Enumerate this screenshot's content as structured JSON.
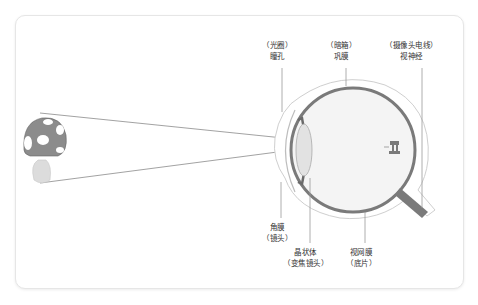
{
  "diagram": {
    "title": "",
    "object": "mushroom",
    "colors": {
      "line": "#8a8a8a",
      "eye_wall": "#7a7a7a",
      "eye_fill": "#f3f3f3",
      "lens_fill": "#e2e2e2",
      "mushroom_cap": "#8c8c8c",
      "mushroom_stem": "#dcdcdc",
      "border": "#e6e6e6"
    },
    "labels_top": [
      {
        "id": "pupil",
        "line1": "（光圈）",
        "line2": "瞳孔"
      },
      {
        "id": "sclera",
        "line1": "（暗箱）",
        "line2": "巩膜"
      },
      {
        "id": "optic-nerve",
        "line1": "（摄像头电线）",
        "line2": "视神经"
      }
    ],
    "labels_bottom": [
      {
        "id": "cornea",
        "line1": "角膜",
        "line2": "（镜头）"
      },
      {
        "id": "lens",
        "line1": "晶状体",
        "line2": "（变焦镜头）"
      },
      {
        "id": "retina",
        "line1": "视网膜",
        "line2": "（底片）"
      }
    ]
  }
}
